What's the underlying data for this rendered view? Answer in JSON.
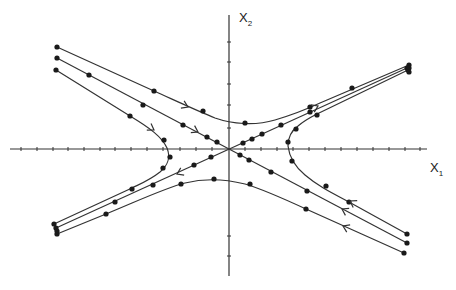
{
  "figure": {
    "type": "phase-portrait-saddle",
    "axes": {
      "x_label_main": "X",
      "x_label_sub": "1",
      "y_label_main": "X",
      "y_label_sub": "2",
      "origin": [
        229,
        149
      ],
      "x_axis": {
        "from": 10,
        "to": 427,
        "tick_xs": [
          21,
          37,
          53,
          68,
          84,
          100,
          115,
          131,
          147,
          163,
          180,
          196,
          212,
          245,
          261,
          277,
          293,
          309,
          325,
          341,
          357,
          373,
          389,
          405,
          420
        ]
      },
      "y_axis": {
        "from": 15,
        "to": 276,
        "tick_ys": [
          42,
          62,
          84,
          105,
          128,
          236,
          256
        ]
      }
    },
    "colors": {
      "line": "#333333",
      "dot": "#1a1a1a",
      "background": "#ffffff"
    },
    "trajectories": [
      {
        "name": "upper-hyperbola",
        "path": "M57,47 L154,91 C185,105 200,112 215,118 C232,124 255,126 275,120 C295,114 305,110 320,103 L409,65",
        "dots": [
          [
            57,
            47
          ],
          [
            154,
            91
          ],
          [
            203,
            111
          ],
          [
            245,
            123
          ],
          [
            310,
            107
          ],
          [
            352,
            88
          ],
          [
            409,
            65
          ]
        ],
        "arrows": [
          {
            "at": [
              188,
              107
            ],
            "angle": 24
          }
        ]
      },
      {
        "name": "stable-manifold-upper-left",
        "path": "M57,58 L229,149",
        "dots": [
          [
            57,
            58
          ],
          [
            89,
            75
          ],
          [
            143,
            105
          ],
          [
            183,
            125
          ],
          [
            207,
            137
          ],
          [
            217,
            142
          ]
        ],
        "arrows": [
          {
            "at": [
              198,
              132
            ],
            "angle": 28
          }
        ]
      },
      {
        "name": "left-hyperbola",
        "path": "M56,70 L130,116 C150,128 162,137 167,148 C171,158 168,165 160,172 C150,180 140,184 132,188 L54,224",
        "dots": [
          [
            56,
            70
          ],
          [
            130,
            116
          ],
          [
            164,
            140
          ],
          [
            170,
            157
          ],
          [
            163,
            168
          ],
          [
            132,
            189
          ],
          [
            54,
            224
          ]
        ],
        "arrows": [
          {
            "at": [
              154,
              130
            ],
            "angle": 32
          }
        ]
      },
      {
        "name": "unstable-manifold",
        "path": "M56,228 L407,68",
        "dots": [
          [
            56,
            228
          ],
          [
            115,
            202
          ],
          [
            153,
            185
          ],
          [
            194,
            165
          ],
          [
            211,
            157
          ],
          [
            243,
            143
          ],
          [
            252,
            139
          ],
          [
            262,
            134
          ],
          [
            281,
            125
          ],
          [
            310,
            112
          ],
          [
            407,
            68
          ]
        ],
        "arrows": [
          {
            "at": [
              177,
              174
            ],
            "angle": 155
          },
          {
            "at": [
              318,
              106
            ],
            "angle": -25
          }
        ]
      },
      {
        "name": "lower-hyperbola",
        "path": "M57,234 L106,214 C140,200 165,188 185,183 C205,178 225,179 245,184 C262,189 280,197 306,209 L404,253",
        "dots": [
          [
            57,
            234
          ],
          [
            106,
            214
          ],
          [
            181,
            184
          ],
          [
            214,
            179
          ],
          [
            250,
            184
          ],
          [
            306,
            209
          ],
          [
            404,
            253
          ]
        ],
        "arrows": [
          {
            "at": [
              343,
              226
            ],
            "angle": 205
          }
        ]
      },
      {
        "name": "stable-manifold-lower-right",
        "path": "M407,243 L229,149",
        "dots": [
          [
            407,
            243
          ],
          [
            307,
            191
          ],
          [
            271,
            172
          ],
          [
            249,
            160
          ],
          [
            240,
            155
          ]
        ],
        "arrows": [
          {
            "at": [
              342,
              209
            ],
            "angle": 208
          }
        ]
      },
      {
        "name": "right-hyperbola",
        "path": "M407,234 L349,202 C330,192 318,186 305,175 C293,165 289,155 288,146 C288,138 291,131 298,126 C305,120 311,117 317,114 L408,70",
        "dots": [
          [
            407,
            234
          ],
          [
            349,
            202
          ],
          [
            326,
            186
          ],
          [
            292,
            161
          ],
          [
            288,
            142
          ],
          [
            296,
            129
          ],
          [
            317,
            115
          ],
          [
            408,
            70
          ]
        ],
        "arrows": [
          {
            "at": [
              350,
              201
            ],
            "angle": 210
          }
        ]
      }
    ],
    "endpoint_dots_extra": [
      [
        409,
        68
      ],
      [
        409,
        72
      ],
      [
        57,
        231
      ]
    ]
  }
}
